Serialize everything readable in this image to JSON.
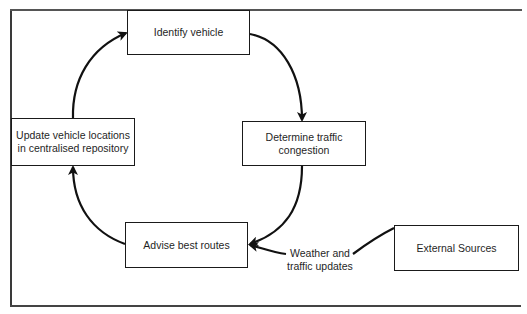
{
  "diagram": {
    "type": "cycle-flowchart",
    "nodes": [
      {
        "id": "identify",
        "label": "Identify vehicle"
      },
      {
        "id": "determine",
        "label": "Determine traffic congestion"
      },
      {
        "id": "advise",
        "label": "Advise best routes"
      },
      {
        "id": "update",
        "label": "Update vehicle locations in centralised repository"
      },
      {
        "id": "external",
        "label": "External Sources"
      }
    ],
    "edges": [
      {
        "from": "identify",
        "to": "determine",
        "label": ""
      },
      {
        "from": "determine",
        "to": "advise",
        "label": ""
      },
      {
        "from": "advise",
        "to": "update",
        "label": ""
      },
      {
        "from": "update",
        "to": "identify",
        "label": ""
      },
      {
        "from": "external",
        "to": "advise",
        "label": "Weather and traffic updates"
      }
    ],
    "edge_label": "Weather and traffic updates",
    "stroke_color": "#111111"
  }
}
